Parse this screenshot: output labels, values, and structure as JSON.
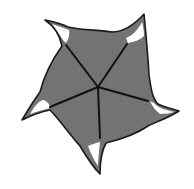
{
  "figure": {
    "description": "Five-armed pinwheel shape with curved hooked tips, gray fill and five dark spokes radiating from center",
    "colors": {
      "background": "#ffffff",
      "fill": "#767676",
      "outline": "#1a1a1a",
      "spoke": "#111111",
      "highlight": "#ffffff"
    },
    "center": [
      98,
      87
    ],
    "arm_count": 5,
    "tips": [
      {
        "name": "top-left",
        "point": [
          45,
          20
        ]
      },
      {
        "name": "top-right",
        "point": [
          144,
          14
        ]
      },
      {
        "name": "right",
        "point": [
          179,
          111
        ]
      },
      {
        "name": "bottom",
        "point": [
          100,
          174
        ]
      },
      {
        "name": "left",
        "point": [
          22,
          120
        ]
      }
    ],
    "spoke_ends": [
      [
        66,
        43
      ],
      [
        128,
        43
      ],
      [
        150,
        101
      ],
      [
        100,
        140
      ],
      [
        48,
        107
      ]
    ]
  }
}
